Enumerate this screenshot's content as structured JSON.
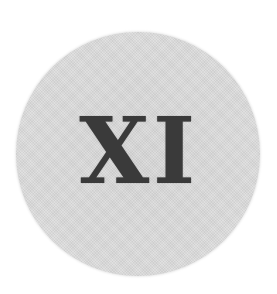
{
  "badge": {
    "numeral": "XI",
    "colors": {
      "circle_fill": "#dedede",
      "text": "#3a3a3a",
      "background": "#ffffff"
    }
  }
}
